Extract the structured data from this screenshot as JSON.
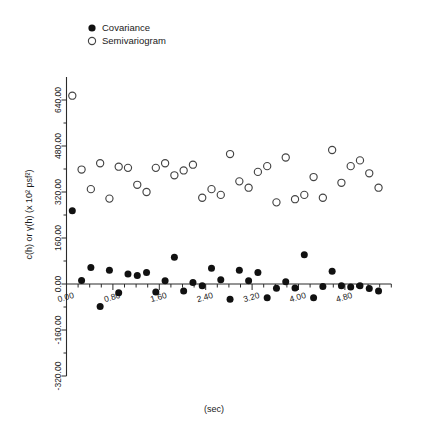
{
  "chart_data": {
    "type": "scatter",
    "title": "",
    "xlabel": "(sec)",
    "ylabel": "c(h) or γ(h) (x 10² psf²)",
    "xlim": [
      0.0,
      5.6
    ],
    "ylim": [
      -320.0,
      720.0
    ],
    "xticks": [
      0.0,
      0.8,
      1.6,
      2.4,
      3.2,
      4.0,
      4.8
    ],
    "xtick_labels": [
      "0.00",
      "0.80",
      "1.60",
      "2.40",
      "3.20",
      "4.00",
      "4.80"
    ],
    "xminor_step": 0.2,
    "yticks": [
      -320.0,
      -160.0,
      0.0,
      160.0,
      320.0,
      480.0,
      640.0
    ],
    "ytick_labels": [
      "-320.00",
      "-160.00",
      "0.00",
      "160.00",
      "320.00",
      "480.00",
      "640.00"
    ],
    "grid": false,
    "legend_position": "top-left",
    "series": [
      {
        "name": "Covariance",
        "marker": "filled-circle",
        "color": "#111111",
        "x": [
          0.1,
          0.26,
          0.42,
          0.58,
          0.74,
          0.9,
          1.06,
          1.22,
          1.38,
          1.54,
          1.7,
          1.86,
          2.02,
          2.18,
          2.34,
          2.5,
          2.66,
          2.82,
          2.98,
          3.14,
          3.3,
          3.46,
          3.62,
          3.78,
          3.94,
          4.1,
          4.26,
          4.42,
          4.58,
          4.74,
          4.9,
          5.06,
          5.22,
          5.38
        ],
        "y": [
          255.0,
          12.0,
          57.0,
          -78.0,
          48.0,
          -30.0,
          35.0,
          30.0,
          40.0,
          -28.0,
          11.0,
          93.0,
          -24.0,
          5.0,
          -6.0,
          55.0,
          15.0,
          -53.0,
          48.0,
          11.0,
          40.0,
          -48.0,
          -15.0,
          8.0,
          -14.0,
          102.0,
          -48.0,
          -9.0,
          44.0,
          -6.0,
          -10.0,
          -6.0,
          -16.0,
          -24.0
        ]
      },
      {
        "name": "Semivariogram",
        "marker": "open-circle",
        "color": "#444444",
        "x": [
          0.1,
          0.26,
          0.42,
          0.58,
          0.74,
          0.9,
          1.06,
          1.22,
          1.38,
          1.54,
          1.7,
          1.86,
          2.02,
          2.18,
          2.34,
          2.5,
          2.66,
          2.82,
          2.98,
          3.14,
          3.3,
          3.46,
          3.62,
          3.78,
          3.94,
          4.1,
          4.26,
          4.42,
          4.58,
          4.74,
          4.9,
          5.06,
          5.22,
          5.38
        ],
        "y": [
          655.0,
          398.0,
          330.0,
          420.0,
          297.0,
          408.0,
          404.0,
          345.0,
          320.0,
          404.0,
          420.0,
          378.0,
          395.0,
          415.0,
          300.0,
          330.0,
          310.0,
          452.0,
          357.0,
          335.0,
          390.0,
          410.0,
          284.0,
          440.0,
          295.0,
          310.0,
          372.0,
          300.0,
          466.0,
          352.0,
          410.0,
          430.0,
          385.0,
          335.0
        ]
      }
    ]
  },
  "legend": {
    "items": [
      {
        "label": "Covariance",
        "marker": "filled-circle"
      },
      {
        "label": "Semivariogram",
        "marker": "open-circle"
      }
    ]
  }
}
